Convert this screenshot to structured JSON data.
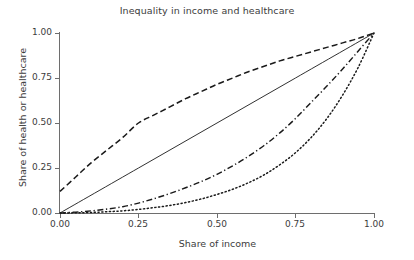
{
  "chart_data": {
    "type": "line",
    "title": "Inequality in income and healthcare",
    "xlabel": "Share of income",
    "ylabel": "Share of health or healthcare",
    "xlim": [
      0.0,
      1.0
    ],
    "ylim": [
      0.0,
      1.0
    ],
    "xticks": [
      "0.00",
      "0.25",
      "0.50",
      "0.75",
      "1.00"
    ],
    "xtick_values": [
      0.0,
      0.25,
      0.5,
      0.75,
      1.0
    ],
    "yticks": [
      "0.00",
      "0.25",
      "0.50",
      "0.75",
      "1.00"
    ],
    "ytick_values": [
      0.0,
      0.25,
      0.5,
      0.75,
      1.0
    ],
    "grid": false,
    "legend": "none",
    "line_color": "#1a1a1a",
    "axis_color": "#6e6e6e",
    "text_color": "#3c3c3c",
    "background": "#ffffff",
    "series": [
      {
        "name": "equality-line",
        "style": "solid",
        "x": [
          0.0,
          0.25,
          0.5,
          0.75,
          1.0
        ],
        "values": [
          0.0,
          0.25,
          0.5,
          0.75,
          1.0
        ]
      },
      {
        "name": "concave-curve",
        "style": "dashed",
        "x": [
          0.0,
          0.05,
          0.1,
          0.15,
          0.2,
          0.25,
          0.3,
          0.35,
          0.4,
          0.45,
          0.5,
          0.55,
          0.6,
          0.65,
          0.7,
          0.75,
          0.8,
          0.85,
          0.9,
          0.95,
          1.0
        ],
        "values": [
          0.12,
          0.2,
          0.28,
          0.35,
          0.42,
          0.5,
          0.545,
          0.59,
          0.635,
          0.675,
          0.715,
          0.75,
          0.785,
          0.815,
          0.845,
          0.87,
          0.895,
          0.92,
          0.945,
          0.97,
          1.0
        ]
      },
      {
        "name": "convex-curve-moderate",
        "style": "dashdot",
        "x": [
          0.0,
          0.05,
          0.1,
          0.15,
          0.2,
          0.25,
          0.3,
          0.35,
          0.4,
          0.45,
          0.5,
          0.55,
          0.6,
          0.65,
          0.7,
          0.75,
          0.8,
          0.85,
          0.9,
          0.95,
          1.0
        ],
        "values": [
          0.0,
          0.005,
          0.012,
          0.022,
          0.035,
          0.055,
          0.08,
          0.108,
          0.14,
          0.175,
          0.215,
          0.262,
          0.315,
          0.375,
          0.445,
          0.525,
          0.615,
          0.705,
          0.8,
          0.9,
          1.0
        ]
      },
      {
        "name": "convex-curve-extreme",
        "style": "dotted",
        "x": [
          0.0,
          0.05,
          0.1,
          0.15,
          0.2,
          0.25,
          0.3,
          0.35,
          0.4,
          0.45,
          0.5,
          0.55,
          0.6,
          0.65,
          0.7,
          0.75,
          0.8,
          0.85,
          0.9,
          0.95,
          1.0
        ],
        "values": [
          0.0,
          0.001,
          0.003,
          0.007,
          0.012,
          0.02,
          0.03,
          0.042,
          0.058,
          0.078,
          0.103,
          0.132,
          0.168,
          0.212,
          0.268,
          0.335,
          0.42,
          0.525,
          0.655,
          0.81,
          1.0
        ]
      }
    ]
  }
}
